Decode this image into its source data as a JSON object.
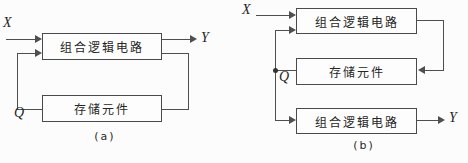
{
  "figure": {
    "background_color": "#fcfcfc",
    "line_color": "#4f4f4f",
    "text_color": "#262626"
  },
  "diagram_a": {
    "caption": "(a)",
    "input_label": "X",
    "output_label": "Y",
    "state_label": "Q",
    "combinational_box": "组合逻辑电路",
    "storage_box": "存储元件"
  },
  "diagram_b": {
    "caption": "(b)",
    "input_label": "X",
    "output_label": "Y",
    "state_label": "Q",
    "combinational_top_box": "组合逻辑电路",
    "storage_box": "存储元件",
    "combinational_bottom_box": "组合逻辑电路"
  }
}
